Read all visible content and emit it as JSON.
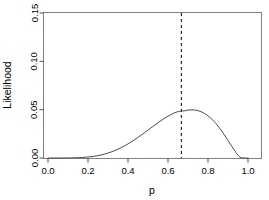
{
  "chart_data": {
    "type": "line",
    "title": "",
    "subtitle": "",
    "xlabel": "p",
    "ylabel": "Likelihood",
    "xlim": [
      0.0,
      1.0
    ],
    "ylim": [
      0.0,
      0.15
    ],
    "grid": false,
    "legend": null,
    "xticks": [
      0.0,
      0.2,
      0.4,
      0.6,
      0.8,
      1.0
    ],
    "xticklabels": [
      "0.0",
      "0.2",
      "0.4",
      "0.6",
      "0.8",
      "1.0"
    ],
    "yticks": [
      0.0,
      0.05,
      0.1,
      0.15
    ],
    "yticklabels": [
      "0.00",
      "0.05",
      "0.10",
      "0.15"
    ],
    "series": [
      {
        "name": "Likelihood",
        "style": "solid",
        "color": "#4d4d4d",
        "x": [
          0.0,
          0.02,
          0.04,
          0.06,
          0.08,
          0.1,
          0.12,
          0.14,
          0.16,
          0.18,
          0.2,
          0.22,
          0.24,
          0.26,
          0.28,
          0.3,
          0.32,
          0.34,
          0.36,
          0.38,
          0.4,
          0.42,
          0.44,
          0.46,
          0.48,
          0.5,
          0.52,
          0.54,
          0.56,
          0.58,
          0.6,
          0.62,
          0.64,
          0.6667,
          0.68,
          0.7,
          0.72,
          0.74,
          0.76,
          0.78,
          0.8,
          0.82,
          0.84,
          0.86,
          0.88,
          0.9,
          0.92,
          0.94,
          0.96,
          0.98,
          1.0
        ],
        "y": [
          0.0,
          0.0,
          0.0,
          1e-05,
          2e-05,
          6e-05,
          0.00012,
          0.00023,
          0.0004,
          0.00065,
          0.00101,
          0.00149,
          0.00212,
          0.00292,
          0.00391,
          0.00511,
          0.00654,
          0.00819,
          0.01009,
          0.01222,
          0.01458,
          0.01714,
          0.01988,
          0.02277,
          0.02577,
          0.02884,
          0.03193,
          0.03498,
          0.03793,
          0.04072,
          0.04327,
          0.04551,
          0.04735,
          0.04861,
          0.04872,
          0.04957,
          0.04984,
          0.04944,
          0.04831,
          0.04638,
          0.04362,
          0.04001,
          0.03557,
          0.03037,
          0.02452,
          0.01823,
          0.01179,
          0.00567,
          0.00084,
          0.0,
          0.0
        ],
        "note": "binomial-likelihood curve, maximum at p = 2/3 with peak value approximately 0.148"
      }
    ],
    "annotations": [
      {
        "name": "mle-vline",
        "type": "vline",
        "x": 0.6667,
        "style": "dashed",
        "color": "#000000",
        "label": ""
      }
    ],
    "peak": {
      "x": 0.6667,
      "y": 0.148
    }
  },
  "axes": {
    "x_label": "p",
    "y_label": "Likelihood"
  }
}
